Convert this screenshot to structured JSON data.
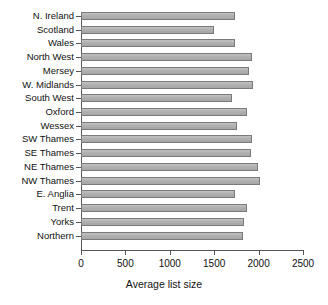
{
  "chart_data": {
    "type": "bar",
    "orientation": "horizontal",
    "title": "",
    "xlabel": "Average list size",
    "ylabel": "",
    "xlim": [
      0,
      2500
    ],
    "xticks": [
      0,
      500,
      1000,
      1500,
      2000,
      2500
    ],
    "xtick_labels": [
      "0",
      "500",
      "1000",
      "1500",
      "2000",
      "2500"
    ],
    "grid": false,
    "legend": false,
    "bar_fill_color": "#b3b3b3",
    "bar_edge_color": "#7a7a7a",
    "axis_color": "#555555",
    "categories": [
      "N. Ireland",
      "Scotland",
      "Wales",
      "North West",
      "Mersey",
      "W. Midlands",
      "South West",
      "Oxford",
      "Wessex",
      "SW Thames",
      "SE Thames",
      "NE Thames",
      "NW Thames",
      "E. Anglia",
      "Trent",
      "Yorks",
      "Northern"
    ],
    "values": [
      1735,
      1500,
      1735,
      1925,
      1890,
      1935,
      1700,
      1870,
      1755,
      1925,
      1915,
      1995,
      2015,
      1735,
      1870,
      1835,
      1825
    ]
  }
}
